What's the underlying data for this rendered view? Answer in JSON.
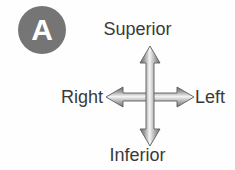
{
  "figure": {
    "panel_label": "A",
    "panel_badge_color": "#757575",
    "panel_badge_text_color": "#ffffff",
    "background_color": "#fefefe",
    "label_color": "#3a3a3a",
    "arrow_color_dark": "#6b6b6b",
    "arrow_color_light": "#f2f2f2",
    "arrow_icon_name": "four-way-direction-arrow"
  },
  "directions": {
    "superior": "Superior",
    "inferior": "Inferior",
    "right": "Right",
    "left": "Left"
  }
}
